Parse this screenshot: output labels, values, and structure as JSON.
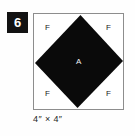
{
  "block": {
    "number": "6",
    "caption": "4″ × 4″",
    "center_piece_label": "A",
    "corner_piece_labels": {
      "top_left": "F",
      "top_right": "F",
      "bottom_left": "F",
      "bottom_right": "F"
    },
    "colors": {
      "badge_background": "#121212",
      "badge_text": "#ffffff",
      "square_border": "#8d8d8d",
      "square_background": "#ffffff",
      "diamond_fill": "#0a0a0a",
      "diamond_label_text": "#f2f2f2",
      "corner_label_text": "#1a1a1a",
      "caption_text": "#1f1f1f",
      "page_background": "#fefefe"
    },
    "geometry": {
      "square": {
        "x": 33,
        "y": 13,
        "width": 91,
        "height": 97
      },
      "diamond_points": "47.5,1 91,48 44.5,96 1,50"
    }
  }
}
